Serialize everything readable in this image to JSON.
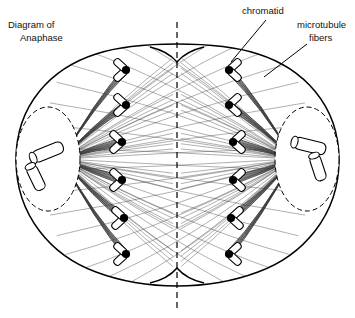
{
  "figure": {
    "title_line1": "Diagram of",
    "title_line2": "Anaphase",
    "ink_color": "#000000",
    "fiber_color": "#3a3a3a",
    "background": "#ffffff"
  },
  "labels": [
    {
      "id": "chromatid",
      "text": "chromatid",
      "lines": [
        "chromatid"
      ]
    },
    {
      "id": "microtubule-fibers",
      "text": "microtubule fibers",
      "lines": [
        "microtubule",
        "fibers"
      ]
    }
  ],
  "structures": {
    "cell_membrane": "cell outline with cleavage furrow at top and bottom",
    "division_axis": "vertical dashed line",
    "centrosome_left": "dashed oval at left pole",
    "centrosome_right": "dashed oval at right pole",
    "centriole_pair_left": "two perpendicular cylinders",
    "centriole_pair_right": "two perpendicular cylinders",
    "chromatid_shape": "V-shaped sister chromatid with black centromere"
  },
  "counts": {
    "chromatids_left": 6,
    "chromatids_right": 6,
    "chromatids_total": 12,
    "centrosomes": 2,
    "centrioles_per_pole": 2,
    "fibers_per_pole": 60
  },
  "chart_data": {
    "type": "diagram",
    "title": "Diagram of Anaphase",
    "poles": [
      {
        "side": "left",
        "x": 62,
        "y": 159
      },
      {
        "side": "right",
        "x": 293,
        "y": 159
      }
    ],
    "chromatids_left": [
      {
        "cx": 126,
        "cy": 70
      },
      {
        "cx": 126,
        "cy": 105
      },
      {
        "cx": 122,
        "cy": 142
      },
      {
        "cx": 122,
        "cy": 180
      },
      {
        "cx": 124,
        "cy": 218
      },
      {
        "cx": 126,
        "cy": 254
      }
    ],
    "chromatids_right": [
      {
        "cx": 229,
        "cy": 70
      },
      {
        "cx": 229,
        "cy": 105
      },
      {
        "cx": 233,
        "cy": 142
      },
      {
        "cx": 233,
        "cy": 180
      },
      {
        "cx": 231,
        "cy": 218
      },
      {
        "cx": 229,
        "cy": 254
      }
    ],
    "axis_x": 177,
    "cell_bounds": {
      "x": 14,
      "y": 40,
      "width": 327,
      "height": 250
    }
  }
}
